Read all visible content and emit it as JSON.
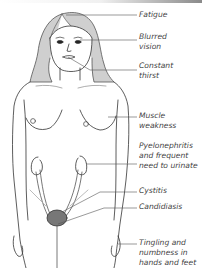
{
  "diagram": {
    "line_color": "#333333",
    "label_color": "#444444",
    "labels": [
      {
        "id": "fatigue",
        "text": "Fatigue",
        "top": 10
      },
      {
        "id": "blurred-vision",
        "text": "Blurred\nvision",
        "top": 32
      },
      {
        "id": "constant-thirst",
        "text": "Constant\nthirst",
        "top": 61
      },
      {
        "id": "muscle-weakness",
        "text": "Muscle\nweakness",
        "top": 111
      },
      {
        "id": "pyelonephritis",
        "text": "Pyelonephritis\nand frequent\nneed to urinate",
        "top": 141
      },
      {
        "id": "cystitis",
        "text": "Cystitis",
        "top": 186
      },
      {
        "id": "candidiasis",
        "text": "Candidiasis",
        "top": 202
      },
      {
        "id": "tingling",
        "text": "Tingling and\nnumbness in\nhands and feet",
        "top": 238
      }
    ]
  }
}
